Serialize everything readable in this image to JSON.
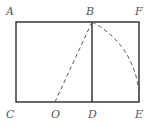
{
  "points": {
    "A": "A",
    "B": "B",
    "F": "F",
    "C": "C",
    "O": "O",
    "D": "D",
    "E": "E"
  },
  "segments": {
    "solid": [
      "AF",
      "CE",
      "AC",
      "FE",
      "BD"
    ],
    "dashed": [
      "OB"
    ],
    "arcs": [
      {
        "from": "B",
        "to": "E",
        "center": "O",
        "style": "dashed"
      }
    ]
  },
  "colors": {
    "line": "#2a2a2a",
    "dashed": "#555555",
    "label": "#555555"
  }
}
